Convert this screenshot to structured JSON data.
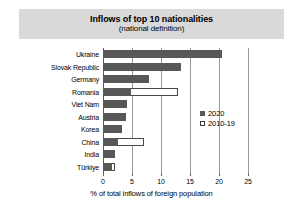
{
  "title": "Inflows of top 10 nationalities",
  "subtitle": "(national definition)",
  "legend": {
    "series_2020": "2020",
    "series_2010_19": "2010-19"
  },
  "axis": {
    "xlabel": "% of total inflows of foreign population",
    "ticks": [
      "0",
      "5",
      "10",
      "15",
      "20",
      "25"
    ]
  },
  "colors": {
    "bar_2020": "#585858",
    "bar_2010_19_outline": "#4a4a4a",
    "title_band": "#d9d9d9",
    "gridline": "#9a9a9a"
  },
  "chart_data": {
    "type": "bar",
    "orientation": "horizontal",
    "title": "Inflows of top 10 nationalities",
    "subtitle": "(national definition)",
    "xlabel": "% of total inflows of foreign population",
    "ylabel": "",
    "xlim": [
      0,
      25
    ],
    "xticks": [
      0,
      5,
      10,
      15,
      20,
      25
    ],
    "grid": true,
    "legend_position": "right-middle",
    "categories": [
      "Ukraine",
      "Slovak Republic",
      "Germany",
      "Romania",
      "Viet Nam",
      "Austria",
      "Korea",
      "China",
      "India",
      "Türkiye"
    ],
    "series": [
      {
        "name": "2020",
        "values": [
          20.5,
          13.4,
          7.9,
          4.9,
          4.2,
          3.9,
          3.2,
          2.6,
          2.0,
          1.6
        ]
      },
      {
        "name": "2010-19",
        "values": [
          16.7,
          4.3,
          7.0,
          12.9,
          1.5,
          1.5,
          1.7,
          7.0,
          1.0,
          2.1
        ]
      }
    ]
  }
}
